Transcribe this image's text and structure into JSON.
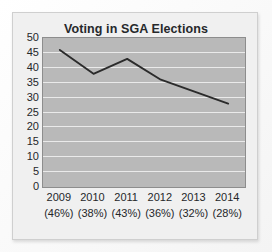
{
  "chart_data": {
    "type": "line",
    "title": "Voting in SGA Elections",
    "xlabel": "",
    "ylabel": "",
    "categories": [
      "2009",
      "2010",
      "2011",
      "2012",
      "2013",
      "2014"
    ],
    "point_labels": [
      "(46%)",
      "(38%)",
      "(43%)",
      "(36%)",
      "(32%)",
      "(28%)"
    ],
    "values": [
      46,
      38,
      43,
      36,
      32,
      28
    ],
    "series": [
      {
        "name": "Voting in SGA Elections",
        "values": [
          46,
          38,
          43,
          36,
          32,
          28
        ]
      }
    ],
    "ylim": [
      0,
      50
    ],
    "ytick_labels": [
      "50",
      "45",
      "40",
      "35",
      "30",
      "25",
      "20",
      "15",
      "10",
      "5",
      "0"
    ],
    "ytick_values": [
      50,
      45,
      40,
      35,
      30,
      25,
      20,
      15,
      10,
      5,
      0
    ],
    "grid": true,
    "legend": false,
    "legend_position": "none",
    "colors": {
      "line": "#2b2b2b",
      "plot_background": "#b9b9b9",
      "gridline": "#eeeeee",
      "card_background": "#f0f0f0",
      "text": "#25272a",
      "plot_border": "#8d8d8d"
    }
  }
}
